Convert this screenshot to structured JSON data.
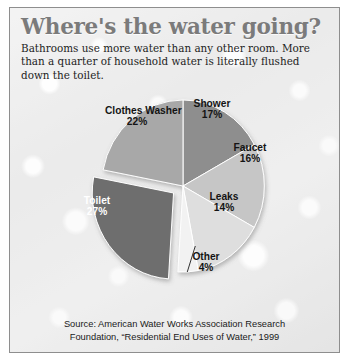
{
  "header": {
    "title": "Where's the water going?",
    "deck": "Bathrooms use more water than any other room. More than a quarter of household water is literally flushed down the toilet."
  },
  "footer": {
    "source_line_1": "Source: American Water Works Association Research",
    "source_line_2": "Foundation, “Residential End Uses of Water,” 1999"
  },
  "colors": {
    "title": "#7b7b7b",
    "frame": "#8e8e8e",
    "shower": "#8e8e8e",
    "faucet": "#c6c6c6",
    "leaks": "#dedede",
    "other": "#f2f2f2",
    "toilet": "#6e6e6e",
    "clothes_washer": "#a8a8a8",
    "label_text": "#141414",
    "label_text_on_dark": "#ffffff"
  },
  "chart_data": {
    "type": "pie",
    "title": "Where's the water going?",
    "subtitle": "Bathrooms use more water than any other room. More than a quarter of household water is literally flushed down the toilet.",
    "unit": "percent of household water use",
    "start_angle_deg": 0,
    "direction": "clockwise",
    "exploded_slices": [
      "Toilet"
    ],
    "leader_line_slices": [
      "Other"
    ],
    "legend": "none (labels placed on slices)",
    "categories": [
      "Shower",
      "Faucet",
      "Leaks",
      "Other",
      "Toilet",
      "Clothes Washer"
    ],
    "values": [
      17,
      16,
      14,
      4,
      27,
      22
    ],
    "slices": [
      {
        "label": "Shower",
        "pct": 17,
        "pct_text": "17%",
        "color": "#8e8e8e",
        "text_color": "#141414",
        "exploded": false
      },
      {
        "label": "Faucet",
        "pct": 16,
        "pct_text": "16%",
        "color": "#c6c6c6",
        "text_color": "#141414",
        "exploded": false
      },
      {
        "label": "Leaks",
        "pct": 14,
        "pct_text": "14%",
        "color": "#dedede",
        "text_color": "#141414",
        "exploded": false
      },
      {
        "label": "Other",
        "pct": 4,
        "pct_text": "4%",
        "color": "#f2f2f2",
        "text_color": "#141414",
        "exploded": false
      },
      {
        "label": "Toilet",
        "pct": 27,
        "pct_text": "27%",
        "color": "#6e6e6e",
        "text_color": "#ffffff",
        "exploded": true
      },
      {
        "label": "Clothes Washer",
        "pct": 22,
        "pct_text": "22%",
        "color": "#a8a8a8",
        "text_color": "#141414",
        "exploded": false
      }
    ],
    "source": "Source: American Water Works Association Research Foundation, “Residential End Uses of Water,” 1999"
  }
}
